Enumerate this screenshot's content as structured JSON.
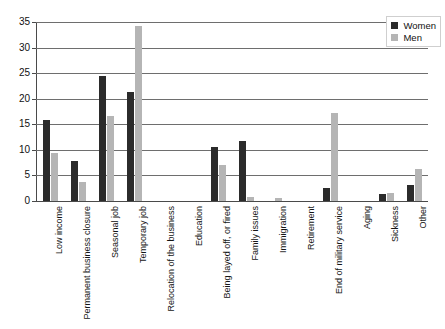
{
  "chart_data": {
    "type": "bar",
    "title": "",
    "xlabel": "",
    "ylabel": "",
    "ylim": [
      0,
      35
    ],
    "yticks": [
      0,
      5,
      10,
      15,
      20,
      25,
      30,
      35
    ],
    "grid": true,
    "legend_position": "top-right",
    "categories": [
      "Low income",
      "Permanent business closure",
      "Seasonal job",
      "Temporary job",
      "Relocation of the business",
      "Education",
      "Being layed off, or fired",
      "Family issues",
      "Immigration",
      "Retirement",
      "End of military service",
      "Aging",
      "Sickness",
      "Other"
    ],
    "series": [
      {
        "name": "Women",
        "color": "#2b2b2b",
        "values": [
          15.9,
          7.9,
          24.5,
          21.3,
          0,
          0,
          10.5,
          11.7,
          0,
          0,
          2.5,
          0,
          1.4,
          3.2
        ]
      },
      {
        "name": "Men",
        "color": "#b5b5b5",
        "values": [
          9.4,
          3.8,
          16.7,
          34.3,
          0,
          0,
          7.0,
          0.8,
          0.6,
          0,
          17.2,
          0,
          1.5,
          6.3
        ]
      }
    ]
  },
  "legend": {
    "items": [
      {
        "label": "Women",
        "color": "#2b2b2b"
      },
      {
        "label": "Men",
        "color": "#b5b5b5"
      }
    ]
  },
  "axis": {
    "y_tick_labels": [
      "0",
      "5",
      "10",
      "15",
      "20",
      "25",
      "30",
      "35"
    ]
  }
}
